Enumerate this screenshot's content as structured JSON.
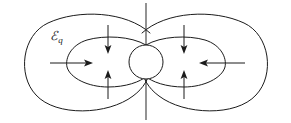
{
  "figure": {
    "background_color": "#ffffff",
    "line_color": "#1b1b1b",
    "axis_color": "#3a3a3a",
    "width": 291,
    "height": 123
  },
  "labels": {
    "field_symbol": "ℰ",
    "field_subscript": "q",
    "field_label_full": "ℰq"
  },
  "charge": {
    "name": "central-charge",
    "center_x": 146,
    "center_y": 62,
    "radius": 17
  },
  "axis": {
    "name": "vertical-axis",
    "x": 146,
    "y_top": 3,
    "y_bottom": 120
  },
  "loops": [
    {
      "name": "outer-left-lobe",
      "side": "left",
      "ring": "outer",
      "extent_x": [
        20,
        150
      ],
      "extent_y": [
        13,
        112
      ]
    },
    {
      "name": "inner-left-lobe",
      "side": "left",
      "ring": "inner",
      "extent_x": [
        68,
        147
      ],
      "extent_y": [
        40,
        86
      ]
    },
    {
      "name": "outer-right-lobe",
      "side": "right",
      "ring": "outer",
      "extent_x": [
        142,
        272
      ],
      "extent_y": [
        13,
        112
      ]
    },
    {
      "name": "inner-right-lobe",
      "side": "right",
      "ring": "inner",
      "extent_x": [
        145,
        224
      ],
      "extent_y": [
        40,
        86
      ]
    }
  ],
  "arrows": [
    {
      "name": "left-horizontal-arrow",
      "direction": "right",
      "x_from": 50,
      "x_to": 92,
      "y": 63
    },
    {
      "name": "right-horizontal-arrow",
      "direction": "left",
      "x_from": 245,
      "x_to": 200,
      "y": 63
    },
    {
      "name": "left-upper-down-arrow",
      "direction": "down",
      "x": 108,
      "y_from": 25,
      "y_to": 53
    },
    {
      "name": "left-lower-up-arrow",
      "direction": "up",
      "x": 108,
      "y_from": 99,
      "y_to": 71
    },
    {
      "name": "right-upper-down-arrow",
      "direction": "down",
      "x": 184,
      "y_from": 25,
      "y_to": 53
    },
    {
      "name": "right-lower-up-arrow",
      "direction": "up",
      "x": 184,
      "y_from": 99,
      "y_to": 71
    }
  ]
}
